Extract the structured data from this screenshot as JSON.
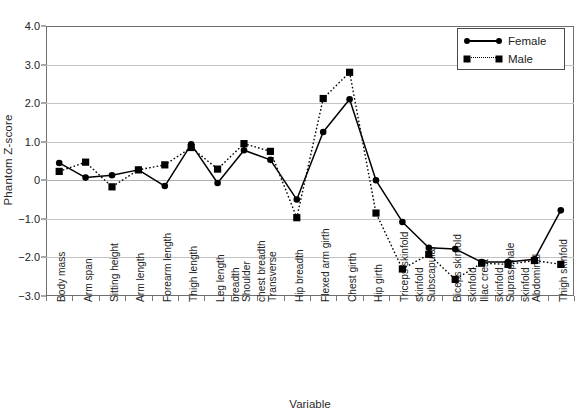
{
  "chart_data": {
    "type": "line",
    "title": "",
    "xlabel": "Variable",
    "ylabel": "Phantom Z-score",
    "ylim": [
      -3.0,
      4.0
    ],
    "ytick_labels": [
      "4.0",
      "3.0",
      "2.0",
      "1.0",
      "0",
      "−1.0",
      "−2.0",
      "−3.0"
    ],
    "ytick_values": [
      4.0,
      3.0,
      2.0,
      1.0,
      0,
      -1.0,
      -2.0,
      -3.0
    ],
    "grid": true,
    "legend_position": "top-right",
    "categories": [
      "Body mass",
      "Arm span",
      "Sitting height",
      "Arm length",
      "Forearm length",
      "Thigh length",
      "Leg length",
      "Shoulder\nbreadth",
      "Transverse\nchest breadth",
      "Hip breadth",
      "Flexed arm girth",
      "Chest girth",
      "Hip girth",
      "Triceps skinfold",
      "Subscapular\nskinfold",
      "Biceps skinfold",
      "Iliac crest\nskinfold",
      "Supraspinale\nskinfold",
      "Abdominal\nskinfold",
      "Thigh skinfold"
    ],
    "series": [
      {
        "name": "Female",
        "marker": "circle",
        "linestyle": "solid",
        "color": "#000000",
        "values": [
          0.45,
          0.07,
          0.13,
          0.27,
          -0.15,
          0.93,
          -0.07,
          0.78,
          0.53,
          -0.5,
          1.25,
          2.1,
          0.0,
          -1.08,
          -1.75,
          -1.78,
          -2.12,
          -2.12,
          -2.05,
          -0.78
        ]
      },
      {
        "name": "Male",
        "marker": "square",
        "linestyle": "dotted",
        "color": "#000000",
        "values": [
          0.23,
          0.47,
          -0.17,
          0.27,
          0.4,
          0.85,
          0.29,
          0.95,
          0.75,
          -0.97,
          2.12,
          2.8,
          -0.85,
          -2.3,
          -1.92,
          -2.57,
          -2.15,
          -2.18,
          -2.08,
          -2.18
        ]
      }
    ]
  },
  "legend": {
    "entries": [
      {
        "label": "Female"
      },
      {
        "label": "Male"
      }
    ]
  }
}
